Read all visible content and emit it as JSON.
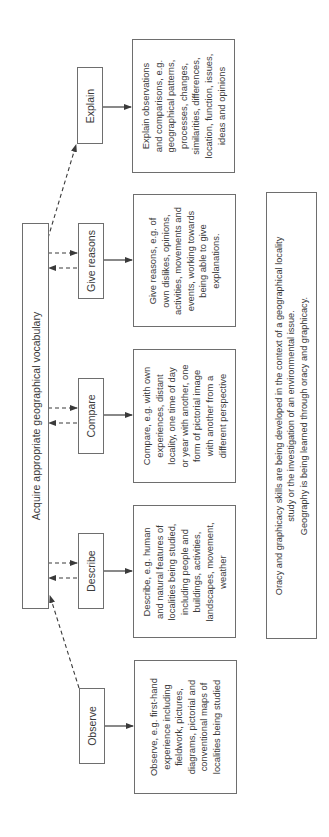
{
  "diagram": {
    "orientation": "rotated-90-ccw",
    "central_bar": {
      "label": "Acquire appropriate geographical vocabulary"
    },
    "stages": [
      {
        "id": "observe",
        "label": "Observe",
        "detail_lines": [
          "Observe, e.g. first-hand",
          "experience including",
          "fieldwork, pictures,",
          "diagrams, pictorial and",
          "conventional maps of",
          "localities being studied"
        ]
      },
      {
        "id": "describe",
        "label": "Describe",
        "detail_lines": [
          "Describe, e.g. human",
          "and natural features of",
          "localities being studied,",
          "including people and",
          "buildings, activities,",
          "landscapes, movement,",
          "weather"
        ]
      },
      {
        "id": "compare",
        "label": "Compare",
        "detail_lines": [
          "Compare, e.g. with own",
          "experiences, distant",
          "locality, one time of day",
          "or year with another, one",
          "form of pictorial image",
          "with another from a",
          "different perspective"
        ]
      },
      {
        "id": "give-reasons",
        "label": "Give reasons",
        "detail_lines": [
          "Give reasons, e.g. of",
          "own dislikes, opinions,",
          "activities, movements and",
          "events, working towards",
          "being able to give",
          "explanations."
        ]
      },
      {
        "id": "explain",
        "label": "Explain",
        "detail_lines": [
          "Explain observations",
          "and comparisons, e.g.",
          "geographical patterns,",
          "processes, changes,",
          "similarities, differences,",
          "location, function, issues,",
          "ideas and opinions"
        ]
      }
    ],
    "note": {
      "lines": [
        "Oracy and graphicacy skills are being developed in the context of a geographical locality",
        "study or the investigation of an environmental issue.",
        "Geography is being learned through oracy and graphicacy."
      ]
    },
    "colors": {
      "border": "#6e6e6e",
      "line": "#3a3a3a",
      "text": "#3a3a3a",
      "background": "#ffffff"
    }
  }
}
